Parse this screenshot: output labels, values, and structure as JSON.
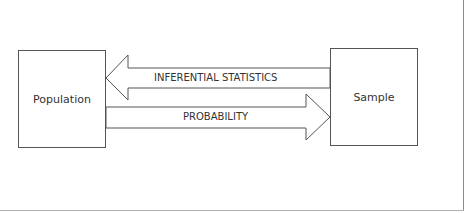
{
  "diagram": {
    "nodes": [
      {
        "id": "population",
        "label": "Population"
      },
      {
        "id": "sample",
        "label": "Sample"
      }
    ],
    "edges": [
      {
        "from": "sample",
        "to": "population",
        "label": "INFERENTIAL STATISTICS",
        "style": "block-arrow-left"
      },
      {
        "from": "population",
        "to": "sample",
        "label": "PROBABILITY",
        "style": "block-arrow-right"
      }
    ],
    "colors": {
      "stroke": "#555555",
      "text": "#333333",
      "background": "#ffffff"
    }
  }
}
